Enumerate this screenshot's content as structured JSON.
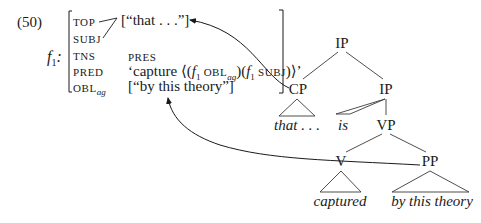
{
  "example": {
    "number": "(50)",
    "fstructure_name": "f",
    "fstructure_sub": "1",
    "fstructure_colon": ":"
  },
  "fstructure": {
    "rows": [
      {
        "attr": "TOP",
        "attr_sub": "",
        "value": "[“that . . .”]"
      },
      {
        "attr": "SUBJ",
        "attr_sub": "",
        "value": ""
      },
      {
        "attr": "TNS",
        "attr_sub": "",
        "value": "PRES"
      },
      {
        "attr": "PRED",
        "attr_sub": "",
        "value_parts": {
          "open": "‘capture ⟨(",
          "f1": "f",
          "f1_sub": "1",
          "obl": " OBL",
          "obl_sub": "ag",
          "mid": ")(",
          "f2": "f",
          "f2_sub": "1",
          "subj": " SUBJ",
          "close": ")⟩’"
        }
      },
      {
        "attr": "OBL",
        "attr_sub": "ag",
        "value": "[“by this theory”]"
      }
    ]
  },
  "tree": {
    "nodes": {
      "root_ip": "IP",
      "cp": "CP",
      "ip": "IP",
      "vp": "VP",
      "v": "V",
      "pp": "PP"
    },
    "leaves": {
      "that": "that . . .",
      "is": "is",
      "captured": "captured",
      "by_this_theory": "by this theory"
    }
  },
  "colors": {
    "ink": "#1a1a1a",
    "lines": "#3a3a3a"
  }
}
